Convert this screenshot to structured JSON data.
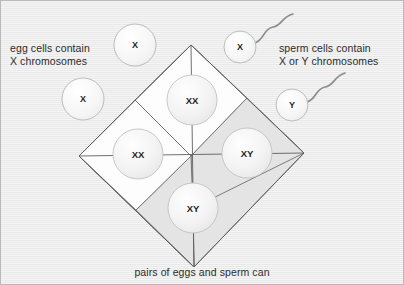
{
  "figure": {
    "background_color": "#e9e9e9",
    "border_color": "#b9b9b9",
    "egg_caption_line1": "egg cells contain",
    "egg_caption_line2": "X chromosomes",
    "sperm_caption_line1": "sperm cells contain",
    "sperm_caption_line2": "X or Y chromosomes",
    "bottom_caption": "pairs of eggs and sperm can"
  },
  "egg_cells": [
    {
      "label": "X",
      "cx": 134,
      "cy": 44,
      "r": 21
    },
    {
      "label": "X",
      "cx": 82,
      "cy": 98,
      "r": 21
    }
  ],
  "sperm_cells": [
    {
      "label": "X",
      "cx": 239,
      "cy": 46,
      "r": 16
    },
    {
      "label": "Y",
      "cx": 291,
      "cy": 104,
      "r": 16
    }
  ],
  "punnett": {
    "top_vertex_x": 190,
    "top_vertex_y": 44,
    "right_vertex_x": 303,
    "right_vertex_y": 152,
    "bottom_vertex_x": 193,
    "bottom_vertex_y": 266,
    "left_vertex_x": 78,
    "left_vertex_y": 155,
    "center_x": 190,
    "center_y": 155,
    "white_fill": "#fdfdfd",
    "gray_fill": "#e4e4e4",
    "stroke": "#6e6e6e",
    "cells": [
      {
        "position": "top",
        "label": "XX",
        "fill": "white",
        "cx": 191,
        "cy": 99
      },
      {
        "position": "left",
        "label": "XX",
        "fill": "white",
        "cx": 137,
        "cy": 153
      },
      {
        "position": "right",
        "label": "XY",
        "fill": "gray",
        "cx": 246,
        "cy": 152
      },
      {
        "position": "bottom",
        "label": "XY",
        "fill": "gray",
        "cx": 192,
        "cy": 207
      }
    ]
  }
}
